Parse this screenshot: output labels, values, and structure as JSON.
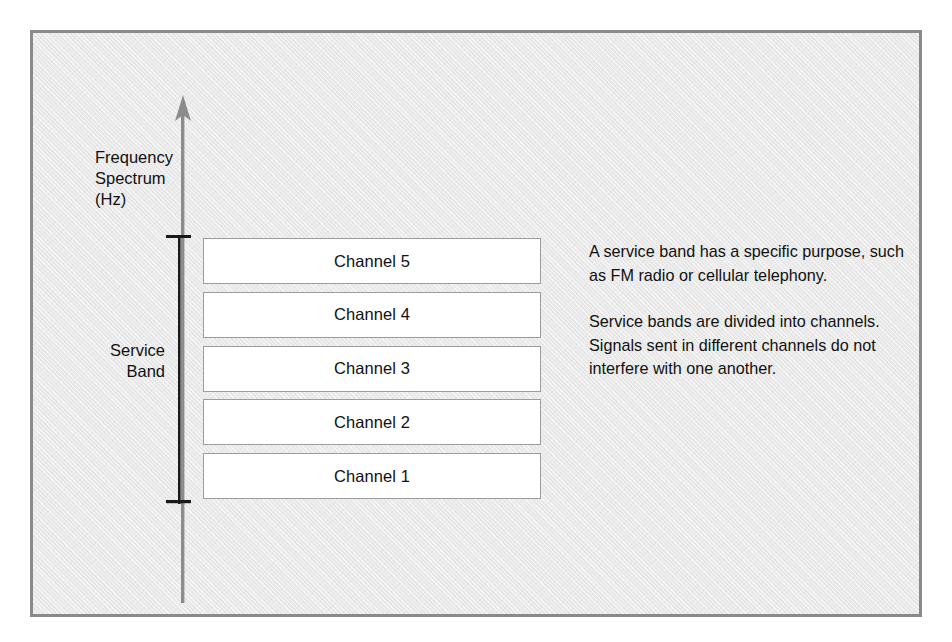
{
  "figure": {
    "axis_label_lines": [
      "Frequency",
      "Spectrum",
      "(Hz)"
    ],
    "service_band_label_lines": [
      "Service",
      "Band"
    ],
    "channels": [
      {
        "label": "Channel 5"
      },
      {
        "label": "Channel 4"
      },
      {
        "label": "Channel 3"
      },
      {
        "label": "Channel 2"
      },
      {
        "label": "Channel 1"
      }
    ],
    "notes": [
      "A service band has a specific purpose, such as FM radio or cellular telephony.",
      "Service bands are divided into channels. Signals sent in different channels do not interfere with one another."
    ],
    "icons": {
      "axis_arrow": "up-arrow-icon",
      "service_bracket": "bracket-icon"
    },
    "colors": {
      "panel_background": "#e9e9e9",
      "panel_border": "#8a8a8a",
      "axis_arrow": "#8c8c8c",
      "bracket": "#1a1a1a",
      "channel_fill": "#ffffff",
      "channel_border": "#9c9c9c",
      "text": "#111111"
    }
  }
}
